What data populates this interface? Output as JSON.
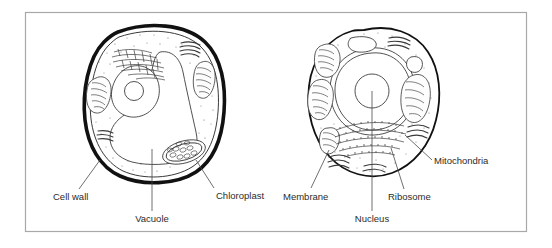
{
  "figure": {
    "type": "biology-diagram",
    "background_color": "#ffffff",
    "frame_color": "#a8a8a8",
    "ink_color": "#1a1a1a",
    "text_color": "#2b2b2b"
  },
  "cells": [
    {
      "id": "plant-cell",
      "position": "left",
      "outline_style": "thick double cell wall",
      "labels": [
        "Cell wall",
        "Vacuole",
        "Chloroplast"
      ]
    },
    {
      "id": "animal-cell",
      "position": "right",
      "outline_style": "thin single membrane",
      "labels": [
        "Membrane",
        "Nucleus",
        "Ribosome",
        "Mitochondria"
      ]
    }
  ],
  "labels": {
    "cell_wall": "Cell wall",
    "vacuole": "Vacuole",
    "chloroplast": "Chloroplast",
    "membrane": "Membrane",
    "nucleus": "Nucleus",
    "ribosome": "Ribosome",
    "mitochondria": "Mitochondria"
  }
}
